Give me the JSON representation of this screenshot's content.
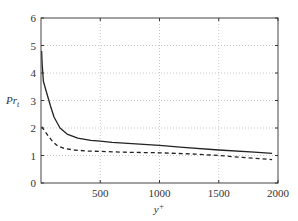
{
  "chart_data": {
    "type": "line",
    "title": "",
    "xlabel": "y+",
    "ylabel": "Pr_t",
    "xlim": [
      0,
      2000
    ],
    "ylim": [
      0,
      6
    ],
    "xticks": [
      500,
      1000,
      1500,
      2000
    ],
    "yticks": [
      0,
      1,
      2,
      3,
      4,
      5,
      6
    ],
    "grid": true,
    "legend": null,
    "series": [
      {
        "name": "solid",
        "style": "solid",
        "color": "#222222",
        "x": [
          5,
          10,
          20,
          40,
          60,
          80,
          110,
          160,
          220,
          310,
          420,
          500,
          600,
          800,
          1000,
          1200,
          1500,
          1800,
          1950
        ],
        "y": [
          4.8,
          4.3,
          3.7,
          3.4,
          3.1,
          2.8,
          2.4,
          2.0,
          1.78,
          1.63,
          1.55,
          1.52,
          1.48,
          1.42,
          1.37,
          1.3,
          1.2,
          1.12,
          1.08
        ]
      },
      {
        "name": "dashed",
        "style": "dashed",
        "color": "#222222",
        "x": [
          5,
          30,
          60,
          100,
          140,
          200,
          280,
          400,
          500,
          700,
          1000,
          1300,
          1500,
          1700,
          1950
        ],
        "y": [
          2.05,
          1.9,
          1.72,
          1.5,
          1.35,
          1.25,
          1.2,
          1.16,
          1.15,
          1.12,
          1.1,
          1.05,
          1.0,
          0.93,
          0.85
        ]
      }
    ]
  },
  "labels": {
    "xlabel_base": "y",
    "xlabel_sup": "+",
    "ylabel_base": "Pr",
    "ylabel_sub": "t"
  }
}
